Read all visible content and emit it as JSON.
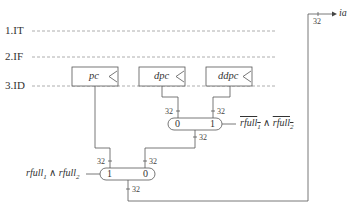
{
  "stages": [
    {
      "label": "1.IT"
    },
    {
      "label": "2.IF"
    },
    {
      "label": "3.ID"
    }
  ],
  "registers": [
    {
      "name": "pc"
    },
    {
      "name": "dpc"
    },
    {
      "name": "ddpc"
    }
  ],
  "mux_top": {
    "input_left": "0",
    "input_right": "1",
    "width_left": "32",
    "width_right": "32",
    "width_out": "32",
    "select_term_a": "rfull",
    "select_sub_a": "1",
    "select_op": " ∧ ",
    "select_term_b": "rfull",
    "select_sub_b": "2"
  },
  "mux_bottom": {
    "input_left": "1",
    "input_right": "0",
    "width_left": "32",
    "width_right": "32",
    "width_out": "32",
    "select_term_a": "rfull",
    "select_sub_a": "1",
    "select_op": " ∧ ",
    "select_term_b": "rfull",
    "select_sub_b": "2"
  },
  "output": {
    "label": "ia",
    "width": "32"
  },
  "colors": {
    "line": "#555555",
    "dash": "#888888"
  }
}
